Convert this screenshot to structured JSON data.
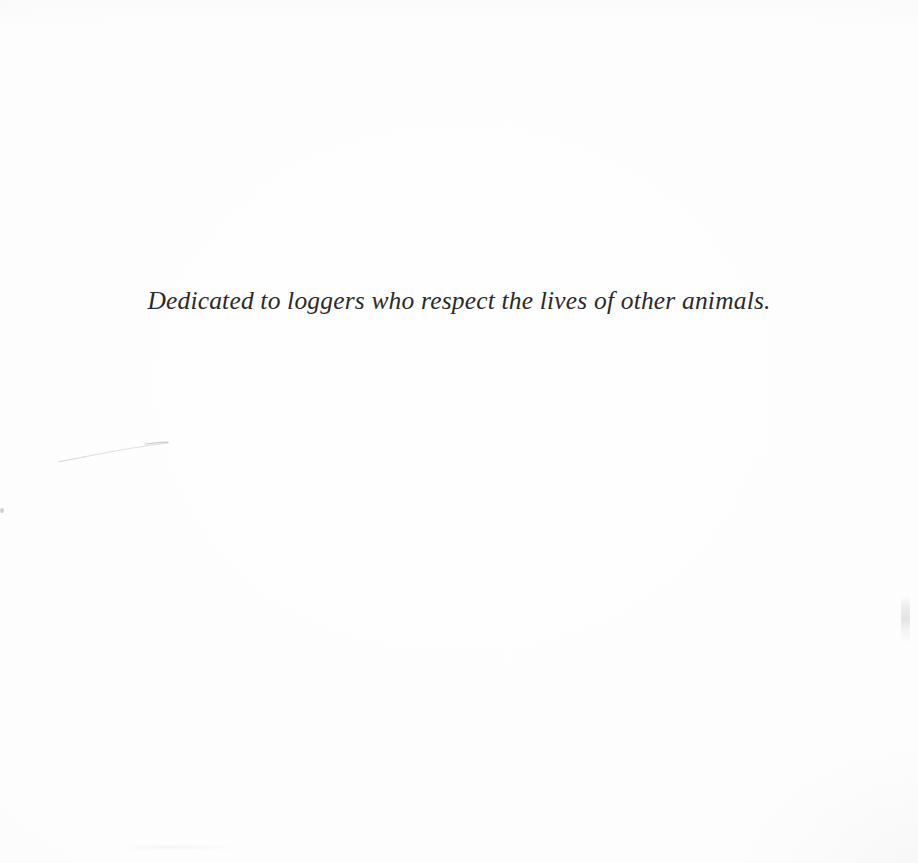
{
  "page": {
    "kind": "book-dedication-page",
    "background_color": "#fdfdfd",
    "text_color": "#2a2a2a"
  },
  "dedication": {
    "text": "Dedicated to loggers who respect the lives of other animals."
  },
  "artifacts": {
    "arc_label": "faint-curved-scan-line",
    "speck_label": "left-edge-speck",
    "smudge_label": "right-edge-smudge",
    "streak_label": "bottom-edge-streak"
  }
}
